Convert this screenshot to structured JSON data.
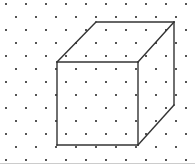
{
  "figure": {
    "canvas": {
      "width": 195,
      "height": 164,
      "background_color": "#ffffff"
    },
    "dot_grid": {
      "name": "staggered-dot-lattice",
      "dot_color": "#555555",
      "dot_size_px": 2,
      "column_spacing_px": 20,
      "row_spacing_px": 13,
      "row_offset_px": 10,
      "origin_x_px": 6,
      "origin_y_px": 4,
      "columns": 10,
      "rows": 13,
      "pattern": "alternating rows shifted horizontally by half the column spacing"
    },
    "border": {
      "color": "#cccccc",
      "width_px": 1,
      "visible_edges": "bottom"
    },
    "cube": {
      "type": "wireframe-cube",
      "stroke_color": "#333333",
      "stroke_width_px": 1.4,
      "fill": "none",
      "projection": "oblique / cabinet",
      "depth_offset": {
        "dx": 37,
        "dy": -40
      },
      "vertices": {
        "front_top_left": {
          "x": 57,
          "y": 62
        },
        "front_top_right": {
          "x": 138,
          "y": 62
        },
        "front_bottom_right": {
          "x": 138,
          "y": 145
        },
        "front_bottom_left": {
          "x": 57,
          "y": 145
        },
        "back_top_left": {
          "x": 96,
          "y": 22
        },
        "back_top_right": {
          "x": 174,
          "y": 22
        },
        "back_bottom_right": {
          "x": 174,
          "y": 105
        },
        "back_bottom_left": {
          "x": 96,
          "y": 105
        }
      },
      "edges": [
        {
          "name": "front-top",
          "from": "front_top_left",
          "to": "front_top_right",
          "hidden": false
        },
        {
          "name": "front-right",
          "from": "front_top_right",
          "to": "front_bottom_right",
          "hidden": false
        },
        {
          "name": "front-bottom",
          "from": "front_bottom_right",
          "to": "front_bottom_left",
          "hidden": false
        },
        {
          "name": "front-left",
          "from": "front_bottom_left",
          "to": "front_top_left",
          "hidden": false
        },
        {
          "name": "back-top",
          "from": "back_top_left",
          "to": "back_top_right",
          "hidden": false
        },
        {
          "name": "back-right",
          "from": "back_top_right",
          "to": "back_bottom_right",
          "hidden": false
        },
        {
          "name": "connector-top-left",
          "from": "front_top_left",
          "to": "back_top_left",
          "hidden": false
        },
        {
          "name": "connector-top-right",
          "from": "front_top_right",
          "to": "back_top_right",
          "hidden": false
        },
        {
          "name": "connector-bottom-right",
          "from": "front_bottom_right",
          "to": "back_bottom_right",
          "hidden": false
        }
      ],
      "hidden_edges_note": "back-left, back-bottom and bottom-left connector are not drawn"
    }
  }
}
